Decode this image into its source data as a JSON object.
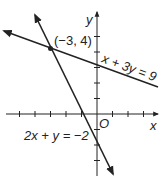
{
  "axes": {
    "x_label": "x",
    "y_label": "y",
    "origin_label": "O",
    "origin_px": [
      97,
      114
    ],
    "unit_px": 15.5,
    "x_ticks": [
      -5,
      -4,
      -3,
      -2,
      -1,
      1,
      2,
      3
    ],
    "y_ticks": [
      -3,
      -2,
      -1,
      1,
      2,
      3,
      4,
      5
    ]
  },
  "lines": [
    {
      "equation": "x + 3y = 9",
      "label": "x + 3y = 9"
    },
    {
      "equation": "2x + y = −2",
      "label": "2x + y = −2"
    }
  ],
  "intersection": {
    "label": "(−3, 4)",
    "x": -3,
    "y": 4
  },
  "colors": {
    "ink": "#222222",
    "background": "#ffffff"
  }
}
